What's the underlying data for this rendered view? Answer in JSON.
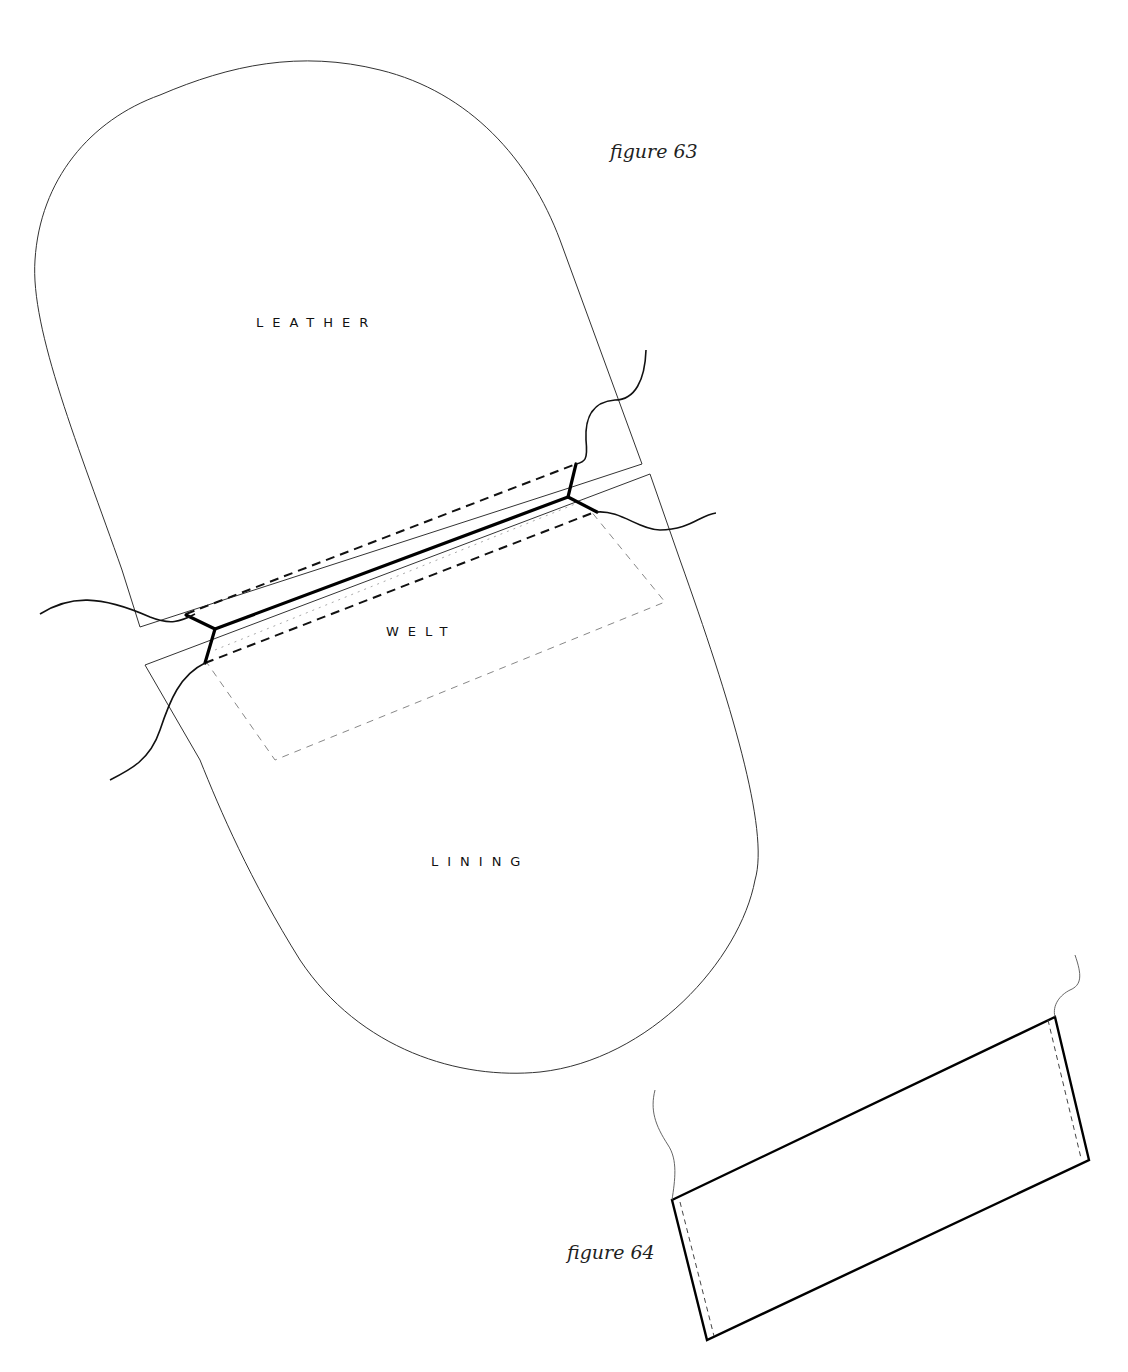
{
  "figures": {
    "figure_63": {
      "caption": "figure 63",
      "labels": {
        "leather": "LEATHER",
        "welt": "WELT",
        "lining": "LINING"
      }
    },
    "figure_64": {
      "caption": "figure 64"
    }
  },
  "colors": {
    "background": "#ffffff",
    "ink": "#000000"
  }
}
